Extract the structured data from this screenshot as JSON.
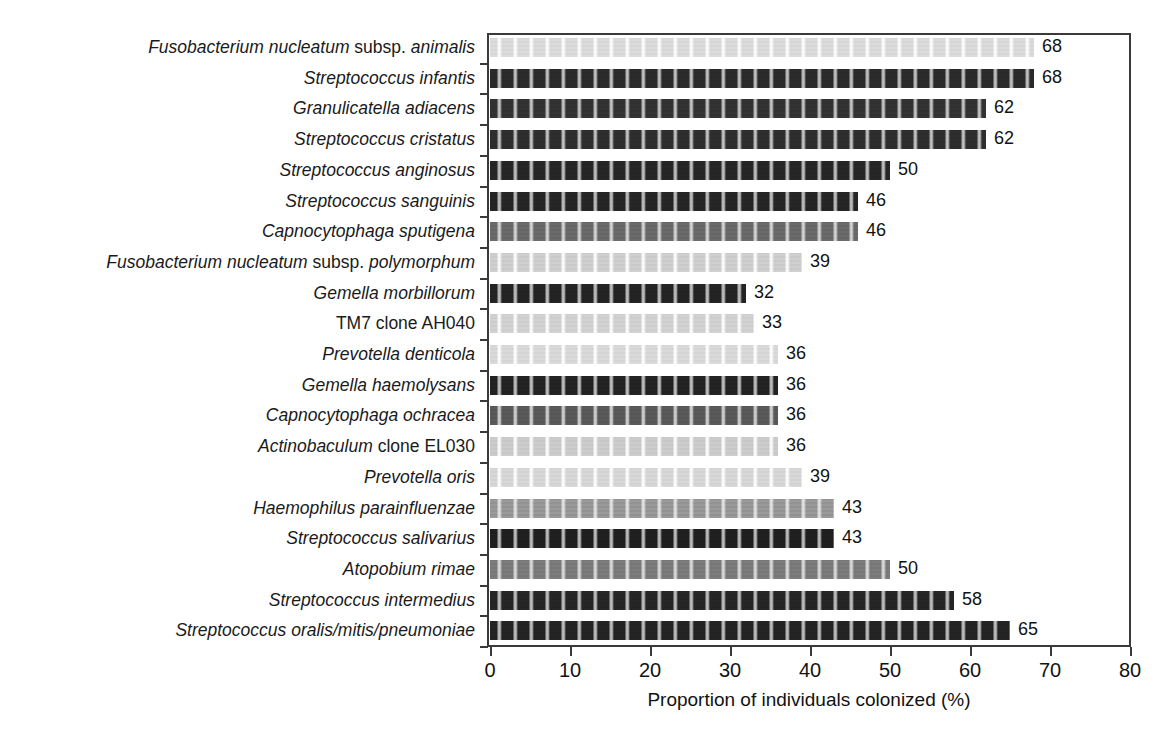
{
  "chart_data": {
    "type": "bar",
    "orientation": "horizontal",
    "title": "",
    "xlabel": "Proportion of individuals colonized (%)",
    "ylabel": "",
    "xlim": [
      0,
      80
    ],
    "xticks": [
      0,
      10,
      20,
      30,
      40,
      50,
      60,
      70,
      80
    ],
    "grid": false,
    "legend": null,
    "categories": [
      "Fusobacterium nucleatum subsp. animalis",
      "Streptococcus infantis",
      "Granulicatella adiacens",
      "Streptococcus cristatus",
      "Streptococcus anginosus",
      "Streptococcus sanguinis",
      "Capnocytophaga sputigena",
      "Fusobacterium nucleatum subsp. polymorphum",
      "Gemella morbillorum",
      "TM7 clone AH040",
      "Prevotella denticola",
      "Gemella haemolysans",
      "Capnocytophaga ochracea",
      "Actinobaculum clone EL030",
      "Prevotella oris",
      "Haemophilus parainfluenzae",
      "Streptococcus salivarius",
      "Atopobium rimae",
      "Streptococcus intermedius",
      "Streptococcus oralis/mitis/pneumoniae"
    ],
    "values": [
      68,
      68,
      62,
      62,
      50,
      46,
      46,
      39,
      32,
      33,
      36,
      36,
      36,
      36,
      39,
      43,
      43,
      50,
      58,
      65
    ]
  },
  "axes": {
    "x_title": "Proportion of individuals colonized (%)",
    "x_tick_labels": [
      "0",
      "10",
      "20",
      "30",
      "40",
      "50",
      "60",
      "70",
      "80"
    ]
  },
  "bars": [
    {
      "label_html": "<span class=\"it\">Fusobacterium nucleatum</span> <span class=\"rm\">subsp.</span> <span class=\"it\">animalis</span>",
      "value": 68,
      "value_text": "68",
      "fill": "#dcdcdc",
      "shade": "light"
    },
    {
      "label_html": "<span class=\"it\">Streptococcus infantis</span>",
      "value": 68,
      "value_text": "68",
      "fill": "#2b2b2b",
      "shade": "dark"
    },
    {
      "label_html": "<span class=\"it\">Granulicatella adiacens</span>",
      "value": 62,
      "value_text": "62",
      "fill": "#333333",
      "shade": "dark"
    },
    {
      "label_html": "<span class=\"it\">Streptococcus cristatus</span>",
      "value": 62,
      "value_text": "62",
      "fill": "#2e2e2e",
      "shade": "dark"
    },
    {
      "label_html": "<span class=\"it\">Streptococcus anginosus</span>",
      "value": 50,
      "value_text": "50",
      "fill": "#272727",
      "shade": "dark"
    },
    {
      "label_html": "<span class=\"it\">Streptococcus sanguinis</span>",
      "value": 46,
      "value_text": "46",
      "fill": "#262626",
      "shade": "dark"
    },
    {
      "label_html": "<span class=\"it\">Capnocytophaga sputigena</span>",
      "value": 46,
      "value_text": "46",
      "fill": "#6b6b6b",
      "shade": "mid"
    },
    {
      "label_html": "<span class=\"it\">Fusobacterium nucleatum</span> <span class=\"rm\">subsp.</span> <span class=\"it\">polymorphum</span>",
      "value": 39,
      "value_text": "39",
      "fill": "#cfcfcf",
      "shade": "light"
    },
    {
      "label_html": "<span class=\"it\">Gemella morbillorum</span>",
      "value": 32,
      "value_text": "32",
      "fill": "#242424",
      "shade": "dark"
    },
    {
      "label_html": "<span class=\"rm\">TM7 clone AH040</span>",
      "value": 33,
      "value_text": "33",
      "fill": "#d2d2d2",
      "shade": "light"
    },
    {
      "label_html": "<span class=\"it\">Prevotella denticola</span>",
      "value": 36,
      "value_text": "36",
      "fill": "#dadada",
      "shade": "light"
    },
    {
      "label_html": "<span class=\"it\">Gemella haemolysans</span>",
      "value": 36,
      "value_text": "36",
      "fill": "#232323",
      "shade": "dark"
    },
    {
      "label_html": "<span class=\"it\">Capnocytophaga ochracea</span>",
      "value": 36,
      "value_text": "36",
      "fill": "#5a5a5a",
      "shade": "mid"
    },
    {
      "label_html": "<span class=\"it\">Actinobaculum</span> <span class=\"rm\">clone EL030</span>",
      "value": 36,
      "value_text": "36",
      "fill": "#cccccc",
      "shade": "light"
    },
    {
      "label_html": "<span class=\"it\">Prevotella oris</span>",
      "value": 39,
      "value_text": "39",
      "fill": "#d8d8d8",
      "shade": "light"
    },
    {
      "label_html": "<span class=\"it\">Haemophilus parainfluenzae</span>",
      "value": 43,
      "value_text": "43",
      "fill": "#9a9a9a",
      "shade": "mid"
    },
    {
      "label_html": "<span class=\"it\">Streptococcus salivarius</span>",
      "value": 43,
      "value_text": "43",
      "fill": "#202020",
      "shade": "dark"
    },
    {
      "label_html": "<span class=\"it\">Atopobium rimae</span>",
      "value": 50,
      "value_text": "50",
      "fill": "#7d7d7d",
      "shade": "mid"
    },
    {
      "label_html": "<span class=\"it\">Streptococcus intermedius</span>",
      "value": 58,
      "value_text": "58",
      "fill": "#262626",
      "shade": "dark"
    },
    {
      "label_html": "<span class=\"it\">Streptococcus oralis/mitis/pneumoniae</span>",
      "value": 65,
      "value_text": "65",
      "fill": "#242424",
      "shade": "dark"
    }
  ],
  "colors": {
    "axis": "#3a3a3a",
    "text": "#121212",
    "background": "#ffffff"
  }
}
